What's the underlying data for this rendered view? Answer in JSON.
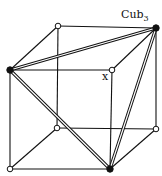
{
  "diagram": {
    "title_label": "Cub",
    "title_subscript": "3",
    "vertex_label": "x",
    "vertices": [
      {
        "id": "top-back-left",
        "state": "open"
      },
      {
        "id": "top-back-right",
        "state": "filled"
      },
      {
        "id": "top-front-left",
        "state": "filled"
      },
      {
        "id": "top-front-right",
        "state": "open"
      },
      {
        "id": "bottom-back-left",
        "state": "open"
      },
      {
        "id": "bottom-back-right",
        "state": "open"
      },
      {
        "id": "bottom-front-left",
        "state": "open"
      },
      {
        "id": "bottom-front-right",
        "state": "filled"
      }
    ],
    "edges": [
      [
        "top-back-left",
        "top-back-right"
      ],
      [
        "top-front-left",
        "top-front-right"
      ],
      [
        "top-back-left",
        "top-front-left"
      ],
      [
        "top-back-right",
        "top-front-right"
      ],
      [
        "bottom-back-left",
        "bottom-back-right"
      ],
      [
        "bottom-front-left",
        "bottom-front-right"
      ],
      [
        "bottom-back-left",
        "bottom-front-left"
      ],
      [
        "bottom-back-right",
        "bottom-front-right"
      ],
      [
        "top-back-left",
        "bottom-back-left"
      ],
      [
        "top-back-right",
        "bottom-back-right"
      ],
      [
        "top-front-left",
        "bottom-front-left"
      ],
      [
        "top-front-right",
        "bottom-front-right"
      ]
    ],
    "double_edges": [
      [
        "top-front-left",
        "top-back-right"
      ],
      [
        "top-front-left",
        "bottom-front-right"
      ],
      [
        "top-back-right",
        "bottom-front-right"
      ]
    ]
  }
}
